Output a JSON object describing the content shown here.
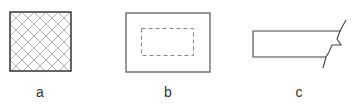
{
  "figures": [
    {
      "id": "a",
      "label": "a",
      "description": "square with diagonal crosshatch pattern"
    },
    {
      "id": "b",
      "label": "b",
      "description": "rectangle with inner dashed rectangle"
    },
    {
      "id": "c",
      "label": "c",
      "description": "rectangle with break line on right end"
    }
  ],
  "colors": {
    "stroke": "#333333",
    "hatch": "#999999",
    "dash": "#888888"
  }
}
